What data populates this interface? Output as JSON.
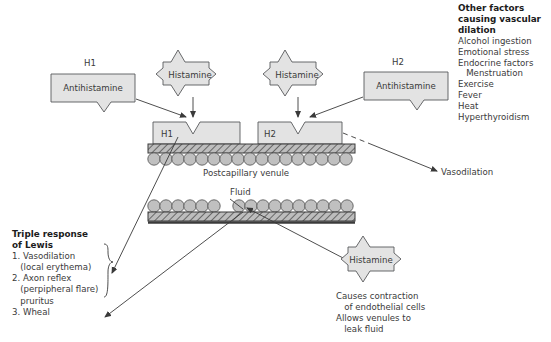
{
  "diagram": {
    "title_alt": "Histamine receptor and triple response of Lewis diagram",
    "colors": {
      "shape_fill": "#e3e3e3",
      "shape_stroke": "#58595b",
      "hatch_fill": "#b9b9b9",
      "circle_fill": "#c0c0c0",
      "text": "#3a3a3a",
      "heading": "#1c1c1c",
      "band_dark": "#3b3b3b"
    }
  },
  "top_labels": {
    "h1": "H1",
    "h2": "H2"
  },
  "ligands": {
    "histamine_left": "Histamine",
    "histamine_right": "Histamine",
    "histamine_bottom": "Histamine"
  },
  "blockers": {
    "antihistamine_left": "Antihistamine",
    "antihistamine_right": "Antihistamine"
  },
  "receptors": {
    "h1": "H1",
    "h2": "H2"
  },
  "vessel": {
    "top_caption": "Postcapillary venule",
    "fluid_label": "Fluid"
  },
  "outcomes": {
    "vasodilation": "Vasodilation"
  },
  "other_factors": {
    "heading_line1": "Other factors",
    "heading_line2": "causing vascular",
    "heading_line3": "dilation",
    "items": [
      "Alcohol ingestion",
      "Emotional stress",
      "Endocrine factors",
      "   Menstruation",
      "Exercise",
      "Fever",
      "Heat",
      "Hyperthyroidism"
    ]
  },
  "triple_response": {
    "heading_line1": "Triple response",
    "heading_line2": "of Lewis",
    "items": [
      "1. Vasodilation",
      "   (local erythema)",
      "2. Axon reflex",
      "   (perpipheral flare)",
      "   pruritus",
      "3. Wheal"
    ]
  },
  "histamine_effects": {
    "lines": [
      "Causes contraction",
      "   of endothelial cells",
      "Allows venules to",
      "   leak fluid"
    ]
  }
}
